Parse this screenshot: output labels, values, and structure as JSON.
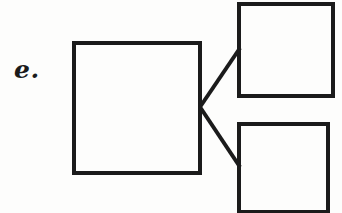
{
  "figure": {
    "label": "e.",
    "background_color": "#fdfdfc",
    "stroke_color": "#1b1b1b",
    "canvas": {
      "width": 342,
      "height": 213
    }
  },
  "shapes": {
    "main_box": {
      "name": "large-square",
      "x": 74,
      "y": 43,
      "width": 126,
      "height": 130,
      "stroke_width": 4,
      "fill": "none",
      "label": ""
    },
    "top_box": {
      "name": "top-right-square",
      "x": 239,
      "y": 4,
      "width": 94,
      "height": 92,
      "stroke_width": 4,
      "fill": "none",
      "label": ""
    },
    "bottom_box": {
      "name": "bottom-right-square",
      "x": 239,
      "y": 124,
      "width": 89,
      "height": 88,
      "stroke_width": 4,
      "fill": "none",
      "label": ""
    }
  },
  "connectors": [
    {
      "name": "connector-to-top-right",
      "from_x": 200,
      "from_y": 107,
      "to_x": 240,
      "to_y": 48,
      "stroke_width": 4
    },
    {
      "name": "connector-to-bottom-right",
      "from_x": 200,
      "from_y": 107,
      "to_x": 240,
      "to_y": 167,
      "stroke_width": 4
    }
  ]
}
